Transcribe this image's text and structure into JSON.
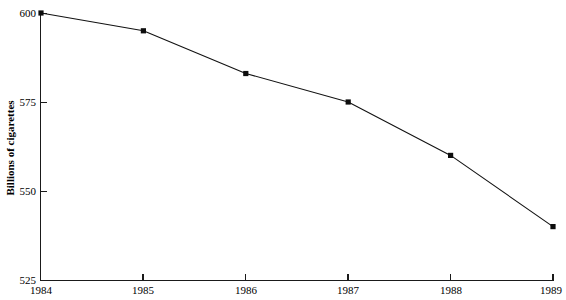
{
  "chart_data": {
    "type": "line",
    "title": "",
    "subtitle": "",
    "xlabel": "",
    "ylabel": "Billions of cigarettes",
    "x": [
      1984,
      1985,
      1986,
      1987,
      1988,
      1989
    ],
    "values": [
      600,
      595,
      583,
      575,
      560,
      540
    ],
    "series": [
      {
        "name": "Billions of cigarettes",
        "values": [
          600,
          595,
          583,
          575,
          560,
          540
        ]
      }
    ],
    "xtick_labels": [
      "1984",
      "1985",
      "1986",
      "1987",
      "1988",
      "1989"
    ],
    "ytick_labels": [
      "525",
      "550",
      "575",
      "600"
    ],
    "yticks": [
      525,
      550,
      575,
      600
    ],
    "xlim": [
      1984,
      1989
    ],
    "ylim": [
      525,
      600
    ],
    "grid": false,
    "legend": false,
    "legend_position": "none",
    "marker": "square",
    "line_color": "#121212",
    "marker_color": "#0d0d0d",
    "axis_color": "#1a1a1a",
    "background_color": "#ffffff"
  },
  "axes": {
    "y_axis_title": "Billions of cigarettes",
    "y_ticks": [
      {
        "label": "600",
        "value": 600
      },
      {
        "label": "575",
        "value": 575
      },
      {
        "label": "550",
        "value": 550
      },
      {
        "label": "525",
        "value": 525
      }
    ],
    "x_ticks": [
      {
        "label": "1984",
        "value": 1984
      },
      {
        "label": "1985",
        "value": 1985
      },
      {
        "label": "1986",
        "value": 1986
      },
      {
        "label": "1987",
        "value": 1987
      },
      {
        "label": "1988",
        "value": 1988
      },
      {
        "label": "1989",
        "value": 1989
      }
    ]
  },
  "clipped_header": {
    "text": ""
  }
}
